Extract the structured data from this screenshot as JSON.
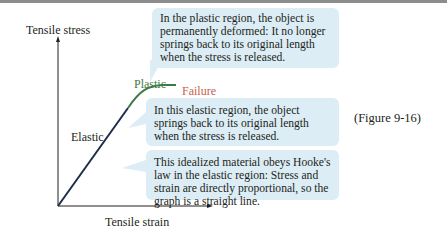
{
  "figure": {
    "ref": "(Figure 9-16)",
    "y_axis_label": "Tensile stress",
    "x_axis_label": "Tensile strain",
    "region_labels": {
      "elastic": "Elastic",
      "plastic": "Plastic",
      "failure": "Failure"
    },
    "colors": {
      "elastic_line": "#1f2d4a",
      "plastic_line": "#3f7a45",
      "plastic_label": "#3f7a45",
      "failure_label": "#c8614a",
      "callout_bg": "#dcedf5"
    },
    "callouts": {
      "plastic": "In the plastic region, the object is permanently deformed: It no longer springs back to its original length when the stress is released.",
      "elastic": "In this elastic region, the object springs back to its original length when the stress is released.",
      "hooke": "This idealized material obeys Hooke's law in the elastic region: Stress and strain are directly proportional, so the graph is a straight line."
    }
  }
}
